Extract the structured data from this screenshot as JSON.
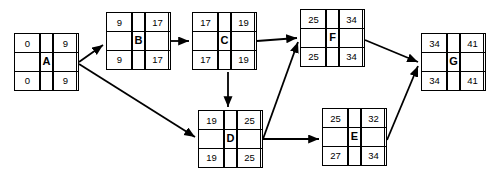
{
  "diagram": {
    "type": "pert-cpm-network",
    "node_cell_meaning": {
      "top_left": "earliest start",
      "top_right": "earliest finish",
      "center": "activity name",
      "bottom_left": "latest start",
      "bottom_right": "latest finish"
    },
    "nodes": [
      {
        "id": "A",
        "label": "A",
        "early_start": "0",
        "early_finish": "9",
        "late_start": "0",
        "late_finish": "9",
        "x": 14,
        "y": 33,
        "w": 63,
        "h": 58
      },
      {
        "id": "B",
        "label": "B",
        "early_start": "9",
        "early_finish": "17",
        "late_start": "9",
        "late_finish": "17",
        "x": 106,
        "y": 12,
        "w": 63,
        "h": 58
      },
      {
        "id": "C",
        "label": "C",
        "early_start": "17",
        "early_finish": "19",
        "late_start": "17",
        "late_finish": "19",
        "x": 192,
        "y": 12,
        "w": 63,
        "h": 58
      },
      {
        "id": "D",
        "label": "D",
        "early_start": "19",
        "early_finish": "25",
        "late_start": "19",
        "late_finish": "25",
        "x": 198,
        "y": 110,
        "w": 63,
        "h": 58
      },
      {
        "id": "E",
        "label": "E",
        "early_start": "25",
        "early_finish": "32",
        "late_start": "27",
        "late_finish": "34",
        "x": 322,
        "y": 108,
        "w": 63,
        "h": 58
      },
      {
        "id": "F",
        "label": "F",
        "early_start": "25",
        "early_finish": "34",
        "late_start": "25",
        "late_finish": "34",
        "x": 300,
        "y": 9,
        "w": 63,
        "h": 58
      },
      {
        "id": "G",
        "label": "G",
        "early_start": "34",
        "early_finish": "41",
        "late_start": "34",
        "late_finish": "41",
        "x": 421,
        "y": 33,
        "w": 63,
        "h": 58
      }
    ],
    "edges": [
      {
        "from": "A",
        "to": "B",
        "path": "M 79,62 L 103,45",
        "name": "edge-a-to-b"
      },
      {
        "from": "A",
        "to": "D",
        "path": "M 79,64 L 195,137",
        "name": "edge-a-to-d"
      },
      {
        "from": "B",
        "to": "C",
        "path": "M 171,41 L 189,41",
        "name": "edge-b-to-c"
      },
      {
        "from": "C",
        "to": "F",
        "path": "M 257,41 L 297,38",
        "name": "edge-c-to-f"
      },
      {
        "from": "C",
        "to": "D",
        "path": "M 228,72 L 228,107",
        "name": "edge-c-to-d"
      },
      {
        "from": "D",
        "to": "F",
        "path": "M 263,139 L 298,42",
        "name": "edge-d-to-f"
      },
      {
        "from": "D",
        "to": "E",
        "path": "M 263,139 L 319,139",
        "name": "edge-d-to-e"
      },
      {
        "from": "F",
        "to": "G",
        "path": "M 365,40 L 418,62",
        "name": "edge-f-to-g"
      },
      {
        "from": "E",
        "to": "G",
        "path": "M 387,140 L 418,66",
        "name": "edge-e-to-g"
      }
    ],
    "colors": {
      "stroke": "#000000",
      "background": "#ffffff"
    }
  }
}
